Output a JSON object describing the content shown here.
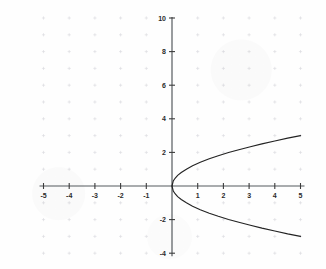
{
  "chart_data": {
    "type": "line",
    "title": "",
    "subtitle": "",
    "xlabel": "",
    "ylabel": "",
    "xlim": [
      -5,
      5
    ],
    "ylim": [
      -4,
      10
    ],
    "grid": true,
    "grid_style": "dotted-crosses at integer coordinates",
    "legend": null,
    "legend_position": "none",
    "equation": "y^2 = 1.8x",
    "orientation": "rightward-opening parabola",
    "vertex": [
      0,
      0
    ],
    "x_ticks": [
      -5,
      -4,
      -3,
      -2,
      -1,
      1,
      2,
      3,
      4,
      5
    ],
    "x_tick_labels": [
      "-5",
      "-4",
      "-3",
      "-2",
      "-1",
      "1",
      "2",
      "3",
      "4",
      "5"
    ],
    "y_ticks": [
      -4,
      -2,
      2,
      4,
      6,
      8,
      10
    ],
    "y_tick_labels": [
      "-4",
      "-2",
      "2",
      "4",
      "6",
      "8",
      "10"
    ],
    "series": [
      {
        "name": "upper branch",
        "x": [
          0,
          0.05,
          0.12,
          0.22,
          0.36,
          0.56,
          0.8,
          1.1,
          1.45,
          1.8,
          2.2,
          2.6,
          3.05,
          3.5,
          4.0,
          4.5,
          5.0
        ],
        "values": [
          0,
          0.3,
          0.46,
          0.63,
          0.8,
          1.0,
          1.2,
          1.41,
          1.62,
          1.8,
          1.99,
          2.16,
          2.34,
          2.51,
          2.68,
          2.85,
          3.0
        ]
      },
      {
        "name": "lower branch",
        "x": [
          0,
          0.05,
          0.12,
          0.22,
          0.36,
          0.56,
          0.8,
          1.1,
          1.45,
          1.8,
          2.2,
          2.6,
          3.05,
          3.5,
          4.0,
          4.5,
          5.0
        ],
        "values": [
          0,
          -0.3,
          -0.46,
          -0.63,
          -0.8,
          -1.0,
          -1.2,
          -1.41,
          -1.62,
          -1.8,
          -1.99,
          -2.16,
          -2.34,
          -2.51,
          -2.68,
          -2.85,
          -3.0
        ]
      }
    ],
    "annotations": [],
    "colors": {
      "curve": "#232323",
      "axis": "#555a5e",
      "tick_label": "#2b2b2b",
      "grid": "#d9d9dd",
      "background": "#fefefe"
    }
  }
}
